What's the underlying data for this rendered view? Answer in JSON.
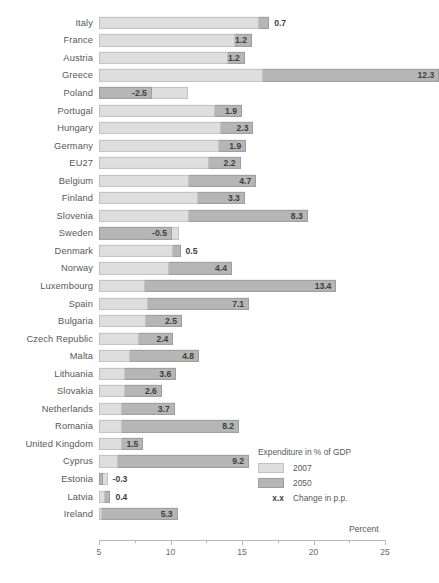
{
  "chart_data": {
    "type": "bar",
    "subtype": "stacked-range",
    "title": "",
    "xlabel": "Percent",
    "ylabel": "",
    "xlim": [
      5,
      25
    ],
    "xticks": [
      5,
      10,
      15,
      20,
      25
    ],
    "xtick_labels": [
      "5",
      "10",
      "15",
      "20",
      "25"
    ],
    "minor_ticks": [
      7.5,
      12.5,
      17.5,
      22.5
    ],
    "grid": false,
    "legend_position": "lower-right",
    "legend_title": "Expenditure in % of GDP",
    "series": [
      {
        "name": "2007",
        "color": "#dedede"
      },
      {
        "name": "2050",
        "color": "#b6b6b6"
      }
    ],
    "annotation_legend": {
      "symbol": "x.x",
      "label": "Change in p.p."
    },
    "categories": [
      "Italy",
      "France",
      "Austria",
      "Greece",
      "Poland",
      "Portugal",
      "Hungary",
      "Germany",
      "EU27",
      "Belgium",
      "Finland",
      "Slovenia",
      "Sweden",
      "Denmark",
      "Norway",
      "Luxembourg",
      "Spain",
      "Bulgaria",
      "Czech Republic",
      "Malta",
      "Lithuania",
      "Slovakia",
      "Netherlands",
      "Romania",
      "United Kingdom",
      "Cyprus",
      "Estonia",
      "Latvia",
      "Ireland"
    ],
    "points": [
      {
        "category": "Italy",
        "v2007": 16.2,
        "change": 0.7,
        "v2050": 16.9,
        "label": "0.7",
        "label_inside": false
      },
      {
        "category": "France",
        "v2007": 14.5,
        "change": 1.2,
        "v2050": 15.7,
        "label": "1.2",
        "label_inside": true
      },
      {
        "category": "Austria",
        "v2007": 14.0,
        "change": 1.2,
        "v2050": 15.2,
        "label": "1.2",
        "label_inside": true
      },
      {
        "category": "Greece",
        "v2007": 16.5,
        "change": 12.3,
        "v2050": 28.8,
        "label": "12.3",
        "label_inside": true
      },
      {
        "category": "Poland",
        "v2007": 11.2,
        "change": -2.5,
        "v2050": 8.7,
        "label": "-2.5",
        "label_inside": true
      },
      {
        "category": "Portugal",
        "v2007": 13.1,
        "change": 1.9,
        "v2050": 15.0,
        "label": "1.9",
        "label_inside": true
      },
      {
        "category": "Hungary",
        "v2007": 13.5,
        "change": 2.3,
        "v2050": 15.8,
        "label": "2.3",
        "label_inside": true
      },
      {
        "category": "Germany",
        "v2007": 13.4,
        "change": 1.9,
        "v2050": 15.3,
        "label": "1.9",
        "label_inside": true
      },
      {
        "category": "EU27",
        "v2007": 12.7,
        "change": 2.2,
        "v2050": 14.9,
        "label": "2.2",
        "label_inside": true
      },
      {
        "category": "Belgium",
        "v2007": 11.3,
        "change": 4.7,
        "v2050": 16.0,
        "label": "4.7",
        "label_inside": true
      },
      {
        "category": "Finland",
        "v2007": 11.9,
        "change": 3.3,
        "v2050": 15.2,
        "label": "3.3",
        "label_inside": true
      },
      {
        "category": "Slovenia",
        "v2007": 11.3,
        "change": 8.3,
        "v2050": 19.6,
        "label": "8.3",
        "label_inside": true
      },
      {
        "category": "Sweden",
        "v2007": 10.6,
        "change": -0.5,
        "v2050": 10.1,
        "label": "-0.5",
        "label_inside": true
      },
      {
        "category": "Denmark",
        "v2007": 10.2,
        "change": 0.5,
        "v2050": 10.7,
        "label": "0.5",
        "label_inside": false
      },
      {
        "category": "Norway",
        "v2007": 9.9,
        "change": 4.4,
        "v2050": 14.3,
        "label": "4.4",
        "label_inside": true
      },
      {
        "category": "Luxembourg",
        "v2007": 8.2,
        "change": 13.4,
        "v2050": 21.6,
        "label": "13.4",
        "label_inside": true
      },
      {
        "category": "Spain",
        "v2007": 8.4,
        "change": 7.1,
        "v2050": 15.5,
        "label": "7.1",
        "label_inside": true
      },
      {
        "category": "Bulgaria",
        "v2007": 8.3,
        "change": 2.5,
        "v2050": 10.8,
        "label": "2.5",
        "label_inside": true
      },
      {
        "category": "Czech Republic",
        "v2007": 7.8,
        "change": 2.4,
        "v2050": 10.2,
        "label": "2.4",
        "label_inside": true
      },
      {
        "category": "Malta",
        "v2007": 7.2,
        "change": 4.8,
        "v2050": 12.0,
        "label": "4.8",
        "label_inside": true
      },
      {
        "category": "Lithuania",
        "v2007": 6.8,
        "change": 3.6,
        "v2050": 10.4,
        "label": "3.6",
        "label_inside": true
      },
      {
        "category": "Slovakia",
        "v2007": 6.8,
        "change": 2.6,
        "v2050": 9.4,
        "label": "2.6",
        "label_inside": true
      },
      {
        "category": "Netherlands",
        "v2007": 6.6,
        "change": 3.7,
        "v2050": 10.3,
        "label": "3.7",
        "label_inside": true
      },
      {
        "category": "Romania",
        "v2007": 6.6,
        "change": 8.2,
        "v2050": 14.8,
        "label": "8.2",
        "label_inside": true
      },
      {
        "category": "United Kingdom",
        "v2007": 6.6,
        "change": 1.5,
        "v2050": 8.1,
        "label": "1.5",
        "label_inside": true
      },
      {
        "category": "Cyprus",
        "v2007": 6.3,
        "change": 9.2,
        "v2050": 15.5,
        "label": "9.2",
        "label_inside": true
      },
      {
        "category": "Estonia",
        "v2007": 5.6,
        "change": -0.3,
        "v2050": 5.3,
        "label": "-0.3",
        "label_inside": false
      },
      {
        "category": "Latvia",
        "v2007": 5.4,
        "change": 0.4,
        "v2050": 5.8,
        "label": "0.4",
        "label_inside": false
      },
      {
        "category": "Ireland",
        "v2007": 5.2,
        "change": 5.3,
        "v2050": 10.5,
        "label": "5.3",
        "label_inside": true
      }
    ]
  }
}
